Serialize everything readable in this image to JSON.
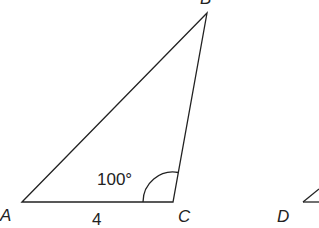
{
  "diagram": {
    "colors": {
      "background": "#ffffff",
      "stroke": "#222222"
    },
    "triangle_abc": {
      "vertices": {
        "A": {
          "label": "A",
          "x": 22,
          "y": 202
        },
        "B": {
          "label": "B",
          "x": 207,
          "y": 13
        },
        "C": {
          "label": "C",
          "x": 173,
          "y": 202
        }
      },
      "side_ac_length": "4",
      "angle_c": "100°"
    },
    "triangle_def": {
      "vertices": {
        "D": {
          "label": "D",
          "x": 303,
          "y": 202
        }
      }
    }
  }
}
